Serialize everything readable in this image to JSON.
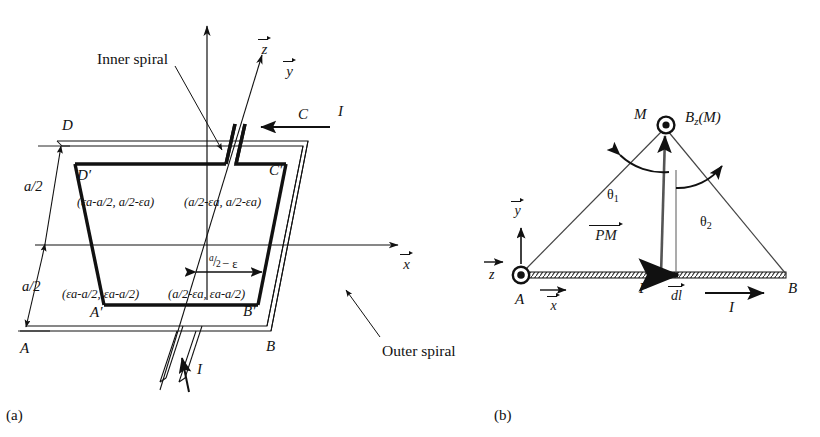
{
  "figure": {
    "background": "#ffffff",
    "ink": "#111111",
    "panels": [
      {
        "id": "a",
        "label": "(a)",
        "caption_role": "subfigure-label"
      },
      {
        "id": "b",
        "label": "(b)",
        "caption_role": "subfigure-label"
      }
    ]
  },
  "panel_a": {
    "title_annotations": {
      "inner_spiral": "Inner spiral",
      "outer_spiral": "Outer spiral"
    },
    "axes": [
      {
        "name": "z",
        "label": "z",
        "direction": "up",
        "vector": true
      },
      {
        "name": "y",
        "label": "y",
        "direction": "up-right",
        "vector": true
      },
      {
        "name": "x",
        "label": "x",
        "direction": "right",
        "vector": true
      }
    ],
    "current_labels": [
      {
        "name": "current-top",
        "label": "I",
        "direction": "left"
      },
      {
        "name": "current-bottom",
        "label": "I",
        "direction": "up"
      }
    ],
    "dimension_labels": [
      {
        "name": "dim-upper-half",
        "label": "a/2"
      },
      {
        "name": "dim-lower-half",
        "label": "a/2"
      },
      {
        "name": "dim-epsilon",
        "numerator": "a",
        "denominator": "2",
        "suffix": "− ε"
      }
    ],
    "outer_corners": [
      {
        "name": "corner-A",
        "label": "A"
      },
      {
        "name": "corner-B",
        "label": "B"
      },
      {
        "name": "corner-C",
        "label": "C"
      },
      {
        "name": "corner-D",
        "label": "D"
      }
    ],
    "inner_corners": [
      {
        "name": "corner-A-prime",
        "label": "A′"
      },
      {
        "name": "corner-B-prime",
        "label": "B′"
      },
      {
        "name": "corner-C-prime",
        "label": "C′"
      },
      {
        "name": "corner-D-prime",
        "label": "D′"
      }
    ],
    "coordinate_pairs": [
      {
        "name": "coord-top-left",
        "text": "(εa-a/2, a/2-εa)",
        "x_expr": "εa-a/2",
        "y_expr": "a/2-εa"
      },
      {
        "name": "coord-top-right",
        "text": "(a/2-εa, a/2-εa)",
        "x_expr": "a/2-εa",
        "y_expr": "a/2-εa"
      },
      {
        "name": "coord-bottom-left",
        "text": "(εa-a/2, εa-a/2)",
        "x_expr": "εa-a/2",
        "y_expr": "εa-a/2"
      },
      {
        "name": "coord-bottom-right",
        "text": "(a/2-εa, εa-a/2)",
        "x_expr": "a/2-εa",
        "y_expr": "εa-a/2"
      }
    ]
  },
  "panel_b": {
    "points": [
      {
        "name": "point-A",
        "label": "A"
      },
      {
        "name": "point-B",
        "label": "B"
      },
      {
        "name": "point-P",
        "label": "P"
      },
      {
        "name": "point-M",
        "label": "M"
      }
    ],
    "axes": [
      {
        "name": "y",
        "label": "y",
        "direction": "up",
        "vector": true
      },
      {
        "name": "z",
        "label": "z",
        "direction": "out-of-page",
        "vector": true
      },
      {
        "name": "x",
        "label": "x",
        "direction": "right",
        "vector": true
      }
    ],
    "field_label": {
      "base": "B",
      "subscript": "z",
      "argument": "(M)",
      "text": "Bz (M)"
    },
    "vectors": [
      {
        "name": "vector-PM",
        "label": "PM",
        "vector": true
      },
      {
        "name": "vector-dl",
        "label": "dl",
        "vector": true
      }
    ],
    "angles": [
      {
        "name": "angle-theta-1",
        "symbol": "θ",
        "subscript": "1"
      },
      {
        "name": "angle-theta-2",
        "symbol": "θ",
        "subscript": "2"
      }
    ],
    "current_label": {
      "name": "current-AB",
      "label": "I",
      "direction": "right"
    }
  }
}
